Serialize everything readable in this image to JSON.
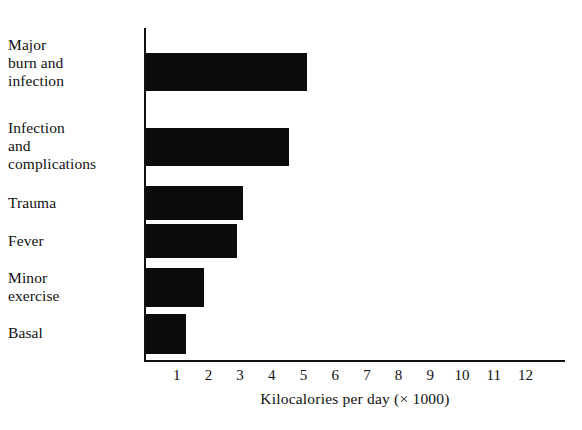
{
  "chart_data": {
    "type": "bar",
    "orientation": "horizontal",
    "title": "",
    "xlabel": "Kilocalories per day (× 1000)",
    "ylabel": "",
    "categories": [
      "Major burn and infection",
      "Infection and complications",
      "Trauma",
      "Fever",
      "Minor exercise",
      "Basal"
    ],
    "values": [
      5.1,
      4.55,
      3.1,
      2.9,
      1.85,
      1.3
    ],
    "xlim": [
      0,
      12.8
    ],
    "xticks": [
      1,
      2,
      3,
      4,
      5,
      6,
      7,
      8,
      9,
      10,
      11,
      12
    ],
    "xtick_labels": [
      "1",
      "2",
      "3",
      "4",
      "5",
      "6",
      "7",
      "8",
      "9",
      "10",
      "11",
      "12"
    ],
    "grid": false,
    "legend": null,
    "bar_color": "#0c0c0c",
    "axis_color": "#111111",
    "background": "#ffffff"
  },
  "axis": {
    "x_title": "Kilocalories per day (× 1000)"
  },
  "categories": [
    {
      "label_line_1": "Major",
      "label_line_2": "burn and",
      "label_line_3": "infection"
    },
    {
      "label_line_1": "Infection",
      "label_line_2": "and",
      "label_line_3": "complications"
    },
    {
      "label_line_1": "Trauma",
      "label_line_2": "",
      "label_line_3": ""
    },
    {
      "label_line_1": "Fever",
      "label_line_2": "",
      "label_line_3": ""
    },
    {
      "label_line_1": "Minor",
      "label_line_2": "exercise",
      "label_line_3": ""
    },
    {
      "label_line_1": "Basal",
      "label_line_2": "",
      "label_line_3": ""
    }
  ]
}
